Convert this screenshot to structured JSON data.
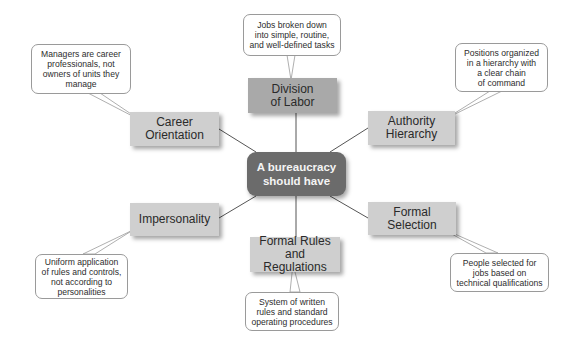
{
  "diagram": {
    "type": "mind-map",
    "center": {
      "label": "A bureaucracy\nshould have"
    },
    "colors": {
      "center_fill": "#6b6b6b",
      "center_text": "#f4f4f4",
      "node_fill": "#cfcfcf",
      "node_fill_top": "#a9a9a9",
      "connector": "#555555",
      "callout_border": "#9a9a9a"
    },
    "branches": [
      {
        "id": "division",
        "label": "Division\nof Labor",
        "description": "Jobs broken down\ninto simple, routine,\nand well-defined tasks"
      },
      {
        "id": "authority",
        "label": "Authority\nHierarchy",
        "description": "Positions organized\nin a hierarchy with\na clear chain\nof command"
      },
      {
        "id": "selection",
        "label": "Formal\nSelection",
        "description": "People selected for\njobs based on\ntechnical qualifications"
      },
      {
        "id": "rules",
        "label": "Formal Rules\nand Regulations",
        "description": "System of written\nrules and standard\noperating procedures"
      },
      {
        "id": "impersonality",
        "label": "Impersonality",
        "description": "Uniform application\nof rules and controls,\nnot according to\npersonalities"
      },
      {
        "id": "career",
        "label": "Career\nOrientation",
        "description": "Managers are career\nprofessionals, not\nowners of units they\nmanage"
      }
    ]
  }
}
